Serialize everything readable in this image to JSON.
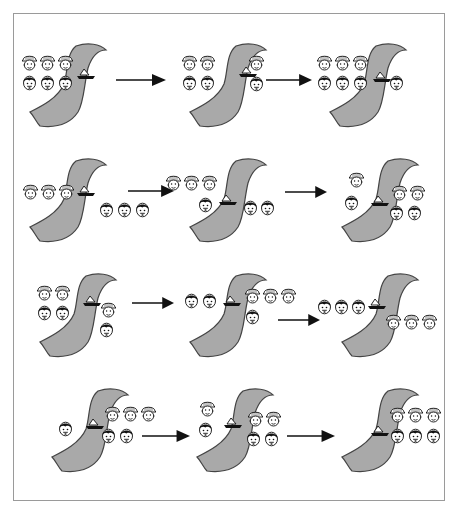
{
  "diagram": {
    "colors": {
      "river": "#a9a9a9",
      "river_edge": "#444444",
      "frame": "#9a9a9a",
      "arrow": "#111111",
      "ink": "#111111"
    },
    "legend": {
      "missionary_icon": "pith-helmet-face",
      "cannibal_icon": "dark-haired-face",
      "boat_icon": "sailboat"
    },
    "rows": [
      {
        "panels": [
          {
            "step": 1,
            "left": {
              "missionaries": 3,
              "cannibals": 3
            },
            "boat": "left",
            "right": {
              "missionaries": 0,
              "cannibals": 0
            }
          },
          {
            "step": 2,
            "left": {
              "missionaries": 2,
              "cannibals": 2
            },
            "boat": "right",
            "right": {
              "missionaries": 1,
              "cannibals": 1
            }
          },
          {
            "step": 3,
            "left": {
              "missionaries": 3,
              "cannibals": 3
            },
            "boat": "left",
            "right": {
              "missionaries": 0,
              "cannibals": 1
            }
          }
        ]
      },
      {
        "panels": [
          {
            "step": 4,
            "left": {
              "missionaries": 3,
              "cannibals": 0
            },
            "boat": "left",
            "right": {
              "missionaries": 0,
              "cannibals": 3
            }
          },
          {
            "step": 5,
            "left": {
              "missionaries": 3,
              "cannibals": 1
            },
            "boat": "left",
            "right": {
              "missionaries": 0,
              "cannibals": 2
            }
          },
          {
            "step": 6,
            "left": {
              "missionaries": 1,
              "cannibals": 1
            },
            "boat": "right",
            "right": {
              "missionaries": 2,
              "cannibals": 2
            }
          }
        ]
      },
      {
        "panels": [
          {
            "step": 7,
            "left": {
              "missionaries": 2,
              "cannibals": 2
            },
            "boat": "left",
            "right": {
              "missionaries": 1,
              "cannibals": 1
            }
          },
          {
            "step": 8,
            "left": {
              "missionaries": 0,
              "cannibals": 2
            },
            "boat": "right",
            "right": {
              "missionaries": 3,
              "cannibals": 1
            }
          },
          {
            "step": 9,
            "left": {
              "missionaries": 0,
              "cannibals": 3
            },
            "boat": "left",
            "right": {
              "missionaries": 3,
              "cannibals": 0
            }
          }
        ]
      },
      {
        "panels": [
          {
            "step": 10,
            "left": {
              "missionaries": 0,
              "cannibals": 1
            },
            "boat": "right",
            "right": {
              "missionaries": 3,
              "cannibals": 2
            }
          },
          {
            "step": 11,
            "left": {
              "missionaries": 1,
              "cannibals": 1
            },
            "boat": "left",
            "right": {
              "missionaries": 2,
              "cannibals": 2
            }
          },
          {
            "step": 12,
            "left": {
              "missionaries": 0,
              "cannibals": 0
            },
            "boat": "right",
            "right": {
              "missionaries": 3,
              "cannibals": 3
            }
          }
        ]
      }
    ],
    "arrows_per_row": 2
  }
}
